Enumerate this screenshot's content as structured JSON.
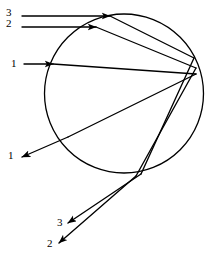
{
  "figure": {
    "background_color": "#ffffff",
    "stroke_color": "#000000",
    "width": 209,
    "height": 262
  },
  "circle": {
    "name": "droplet-circle",
    "cx": 124,
    "cy": 93.5,
    "r": 79.5,
    "stroke_width": 1.3,
    "fill": "none"
  },
  "labels": {
    "incoming_3": {
      "text": "3",
      "x": 6,
      "y": 7
    },
    "incoming_2": {
      "text": "2",
      "x": 6,
      "y": 18
    },
    "incoming_1": {
      "text": "1",
      "x": 11,
      "y": 58
    },
    "outgoing_1": {
      "text": "1",
      "x": 8,
      "y": 150
    },
    "outgoing_3": {
      "text": "3",
      "x": 57,
      "y": 217
    },
    "outgoing_2": {
      "text": "2",
      "x": 47,
      "y": 238
    }
  },
  "chart_data": {
    "type": "line",
    "xlabel": "",
    "ylabel": "",
    "xlim": [
      0,
      209
    ],
    "ylim": [
      0,
      262
    ],
    "grid": false,
    "legend": "none",
    "series": [
      {
        "name": "ray-3-incoming",
        "label": "3",
        "arrow": "end",
        "points": [
          [
            22,
            16
          ],
          [
            110,
            16
          ]
        ]
      },
      {
        "name": "ray-2-incoming",
        "label": "2",
        "arrow": "end",
        "points": [
          [
            22,
            27
          ],
          [
            96,
            27
          ]
        ]
      },
      {
        "name": "ray-1-incoming",
        "label": "1",
        "arrow": "end",
        "points": [
          [
            24,
            64
          ],
          [
            53,
            64
          ]
        ]
      },
      {
        "name": "ray-1-chord-to-far-side",
        "label": "1",
        "arrow": "none",
        "points": [
          [
            53,
            64
          ],
          [
            196,
            74
          ]
        ]
      },
      {
        "name": "ray-1-internal-reflection",
        "label": "1",
        "arrow": "none",
        "points": [
          [
            196,
            74
          ],
          [
            68,
            137
          ]
        ]
      },
      {
        "name": "ray-1-outgoing",
        "label": "1",
        "arrow": "end",
        "points": [
          [
            68,
            137
          ],
          [
            22,
            157
          ]
        ]
      },
      {
        "name": "ray-3-chord-to-far-side",
        "label": "3",
        "arrow": "none",
        "points": [
          [
            110,
            16
          ],
          [
            194,
            58
          ]
        ]
      },
      {
        "name": "ray-3-internal-reflection",
        "label": "3",
        "arrow": "none",
        "points": [
          [
            194,
            58
          ],
          [
            141,
            174
          ]
        ]
      },
      {
        "name": "ray-3-outgoing",
        "label": "3",
        "arrow": "end",
        "points": [
          [
            141,
            174
          ],
          [
            68,
            223
          ]
        ]
      },
      {
        "name": "ray-2-chord-to-far-side",
        "label": "2",
        "arrow": "none",
        "points": [
          [
            96,
            27
          ],
          [
            196,
            68
          ]
        ]
      },
      {
        "name": "ray-2-internal-reflection",
        "label": "2",
        "arrow": "none",
        "points": [
          [
            196,
            68
          ],
          [
            136,
            176
          ]
        ]
      },
      {
        "name": "ray-2-outgoing",
        "label": "2",
        "arrow": "end",
        "points": [
          [
            136,
            176
          ],
          [
            59,
            243
          ]
        ]
      }
    ],
    "annotations": [
      {
        "text": "3",
        "x": 6,
        "y": 12
      },
      {
        "text": "2",
        "x": 6,
        "y": 23
      },
      {
        "text": "1",
        "x": 11,
        "y": 63
      },
      {
        "text": "1",
        "x": 8,
        "y": 155
      },
      {
        "text": "3",
        "x": 57,
        "y": 222
      },
      {
        "text": "2",
        "x": 47,
        "y": 243
      }
    ]
  }
}
